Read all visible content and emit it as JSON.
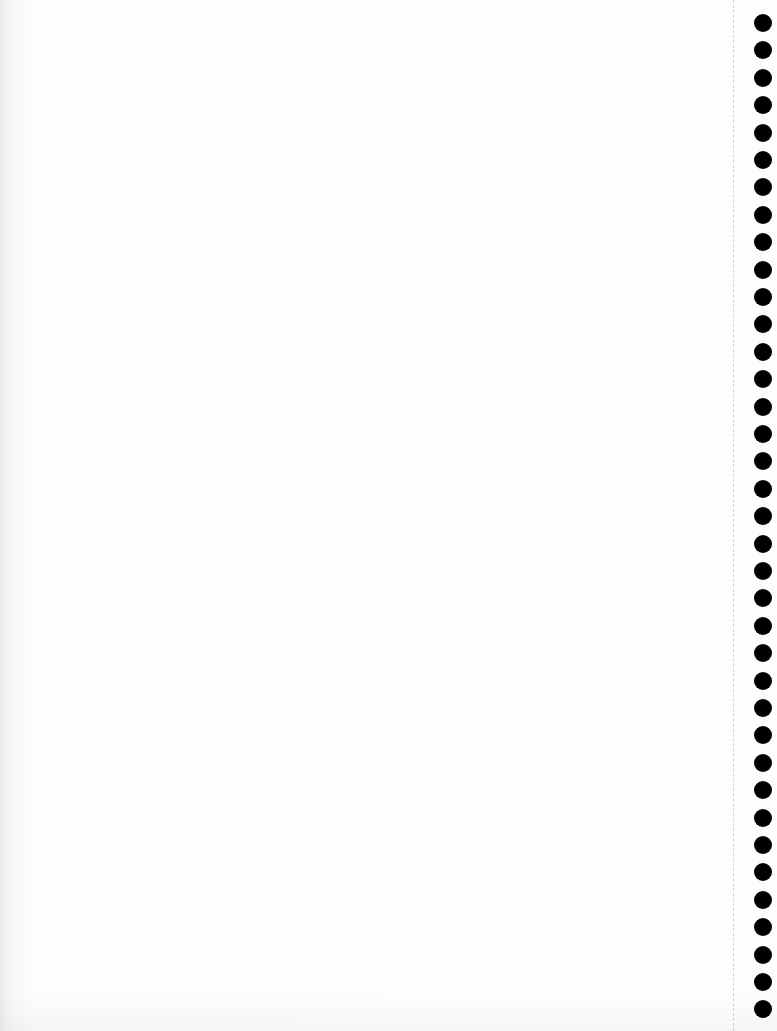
{
  "page": {
    "type": "continuous-feed printer paper (blank, faint bleed-through)",
    "background_color": "#fdfdfd",
    "tear_line_color": "#d3d3d3",
    "hole_color": "#000000"
  },
  "bleed_text": "",
  "feed_holes": {
    "count": 37,
    "first_top": 14,
    "pitch": 27.4,
    "left": 754,
    "diameter": 18
  }
}
